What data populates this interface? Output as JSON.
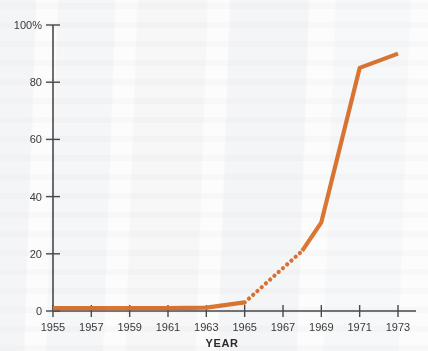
{
  "chart_data": {
    "type": "line",
    "title": "",
    "xlabel": "YEAR",
    "ylabel": "",
    "xlim": [
      1955,
      1973
    ],
    "ylim": [
      0,
      100
    ],
    "grid": false,
    "legend": "none",
    "x_ticks": [
      "1955",
      "1957",
      "1959",
      "1961",
      "1963",
      "1965",
      "1967",
      "1969",
      "1971",
      "1973"
    ],
    "x_tick_values": [
      1955,
      1957,
      1959,
      1961,
      1963,
      1965,
      1967,
      1969,
      1971,
      1973
    ],
    "y_ticks": [
      "0",
      "20",
      "40",
      "60",
      "80",
      "100%"
    ],
    "y_tick_values": [
      0,
      20,
      40,
      60,
      80,
      100
    ],
    "series": [
      {
        "name": "percent",
        "color": "#DE7633",
        "style": "solid",
        "x": [
          1955,
          1957,
          1959,
          1961,
          1963,
          1965
        ],
        "values": [
          1,
          1,
          1,
          1,
          1.2,
          3
        ]
      },
      {
        "name": "percent-estimated",
        "color": "#DE7633",
        "style": "dotted",
        "x": [
          1965,
          1968
        ],
        "values": [
          3,
          21
        ]
      },
      {
        "name": "percent-continued",
        "color": "#DE7633",
        "style": "solid",
        "x": [
          1968,
          1969,
          1971,
          1973
        ],
        "values": [
          21,
          31,
          85,
          90
        ]
      }
    ]
  },
  "axes": {
    "x_axis_name": "year-axis",
    "y_axis_name": "percent-axis"
  }
}
